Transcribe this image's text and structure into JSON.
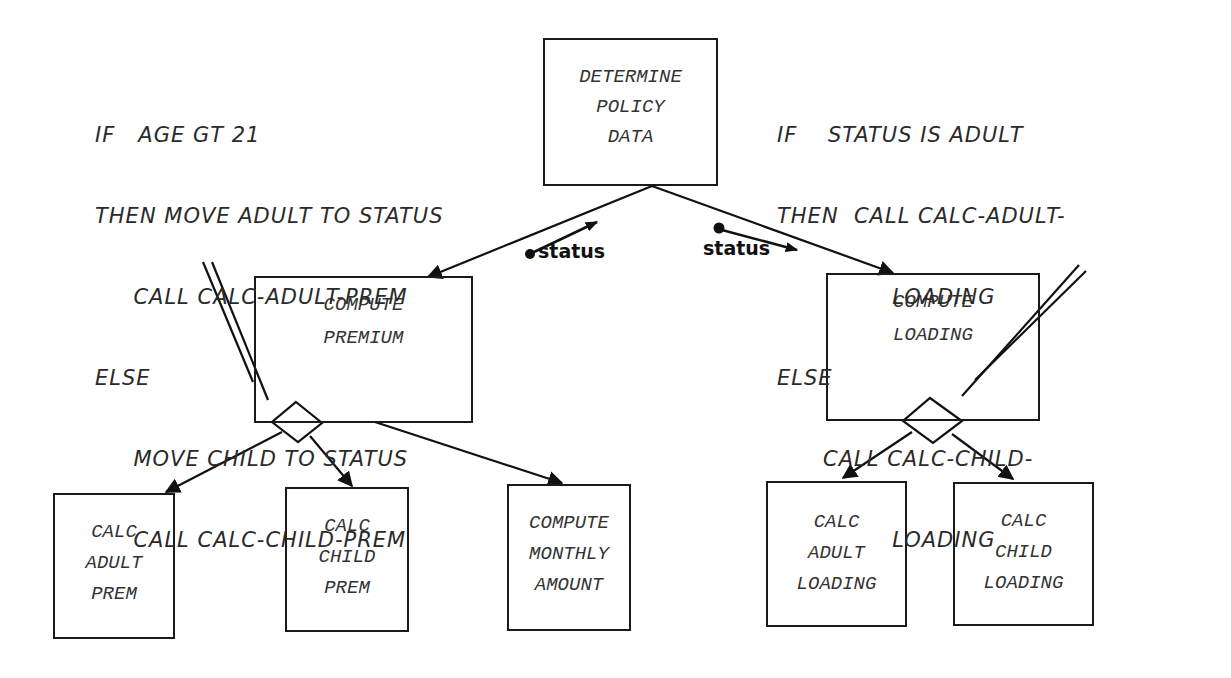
{
  "diagram": {
    "type": "structure-chart",
    "nodes": {
      "determine_policy_data": [
        "DETERMINE",
        "POLICY",
        "DATA"
      ],
      "compute_premium": [
        "COMPUTE",
        "PREMIUM"
      ],
      "compute_loading": [
        "COMPUTE",
        "LOADING"
      ],
      "calc_adult_prem": [
        "CALC",
        "ADULT",
        "PREM"
      ],
      "calc_child_prem": [
        "CALC",
        "CHILD",
        "PREM"
      ],
      "compute_monthly_amount": [
        "COMPUTE",
        "MONTHLY",
        "AMOUNT"
      ],
      "calc_adult_loading": [
        "CALC",
        "ADULT",
        "LOADING"
      ],
      "calc_child_loading": [
        "CALC",
        "CHILD",
        "LOADING"
      ]
    },
    "couples": {
      "left": "status",
      "right": "status"
    },
    "pseudocode_left": [
      "IF   AGE GT 21",
      "THEN MOVE ADULT TO STATUS",
      "     CALL CALC-ADULT-PREM",
      "ELSE",
      "     MOVE CHILD TO STATUS",
      "     CALL CALC-CHILD-PREM"
    ],
    "pseudocode_right": [
      "IF    STATUS IS ADULT",
      "THEN  CALL CALC-ADULT-",
      "               LOADING",
      "ELSE",
      "      CALL CALC-CHILD-",
      "               LOADING"
    ],
    "edges": [
      [
        "determine_policy_data",
        "compute_premium"
      ],
      [
        "determine_policy_data",
        "compute_loading"
      ],
      [
        "compute_premium",
        "calc_adult_prem"
      ],
      [
        "compute_premium",
        "calc_child_prem"
      ],
      [
        "compute_premium",
        "compute_monthly_amount"
      ],
      [
        "compute_loading",
        "calc_adult_loading"
      ],
      [
        "compute_loading",
        "calc_child_loading"
      ]
    ]
  }
}
